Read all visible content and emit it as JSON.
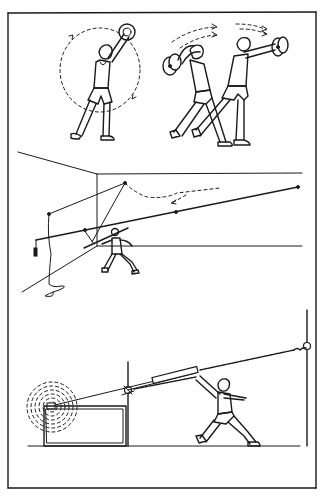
{
  "figure": {
    "type": "line-art illustration",
    "colors": {
      "ink": "#1a1a1a",
      "paper": "#ffffff"
    },
    "panels": [
      {
        "id": "panel-1",
        "description": "Athlete swinging a weight plate in a circle; two athletes swinging plates overhead with motion arrows"
      },
      {
        "id": "panel-2",
        "description": "Javelin thrower training with a cable-and-pulley rig in a room corner"
      },
      {
        "id": "panel-3",
        "description": "Athlete pulling a pole attached to a spring cable between two posts with a coiled spring on the left"
      }
    ]
  }
}
